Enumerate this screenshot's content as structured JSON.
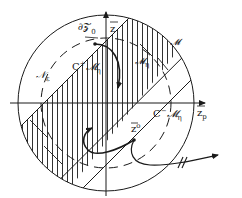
{
  "diagram": {
    "type": "mathematical-phase-space-sketch",
    "colors": {
      "ink": "#1a1a1a",
      "background": "#ffffff"
    },
    "labels": {
      "boundary": "∂𝒵",
      "boundary_sub": "0",
      "axis_vertical": "z",
      "axis_horizontal": "z",
      "axis_horizontal_sub": "p",
      "neighborhood": "𝒩",
      "neighborhood_sub": "ε",
      "manifold": "𝓜",
      "manifold_eta": "𝓜",
      "manifold_eta_sub": "η",
      "region_plus": "C",
      "region_plus_sup": "+",
      "region_plus_set": "𝓜",
      "region_plus_sub": "η",
      "region_minus": "C",
      "region_minus_sup": "−",
      "region_minus_set": "𝓜",
      "region_minus_sub": "η",
      "initial_point": "z",
      "initial_point_sup": "o"
    },
    "elements": {
      "outer_circle": {
        "cx": 106,
        "cy": 103,
        "r": 88,
        "style": "solid"
      },
      "inner_circle": {
        "cx": 106,
        "cy": 103,
        "r": 65,
        "style": "dashed"
      },
      "horizontal_axis": {
        "x1": 10,
        "y1": 103,
        "x2": 207,
        "y2": 103,
        "arrow": true
      },
      "vertical_axis": {
        "x1": 106,
        "y1": 196,
        "x2": 106,
        "y2": 10,
        "arrow": true
      },
      "hatched_band": {
        "angle_deg": 45,
        "half_width": 22,
        "hatch": "vertical"
      },
      "trajectory_marker": "//"
    }
  }
}
